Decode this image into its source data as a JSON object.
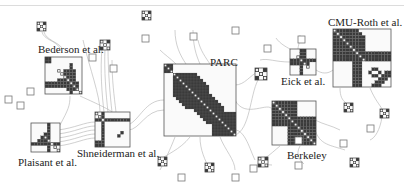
{
  "figure": {
    "type": "NodeTrix-style node-link / adjacency-matrix hybrid",
    "colors": {
      "cell_on": "#3a3a3a",
      "cell_diag": "#f0f0f0",
      "border": "#555555",
      "link": "#b0b0b0",
      "bg": "#ffffff"
    }
  },
  "clusters": [
    {
      "id": "bederson",
      "label": "Bederson et al."
    },
    {
      "id": "plaisant",
      "label": "Plaisant et al."
    },
    {
      "id": "shneiderman",
      "label": "Shneiderman et al."
    },
    {
      "id": "parc",
      "label": "PARC"
    },
    {
      "id": "eick",
      "label": "Eick et al."
    },
    {
      "id": "cmu-roth",
      "label": "CMU-Roth et al."
    },
    {
      "id": "berkeley",
      "label": "Berkeley"
    }
  ]
}
